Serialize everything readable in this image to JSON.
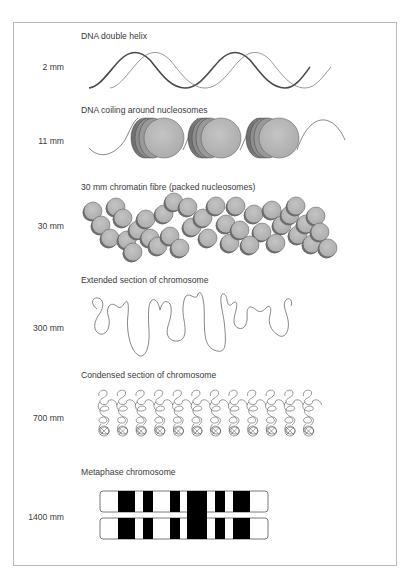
{
  "figure": {
    "stages": [
      {
        "title": "DNA double helix",
        "size_label": "2 mm"
      },
      {
        "title": "DNA coiling around nucleosomes",
        "size_label": "11 mm"
      },
      {
        "title": "30 mm chromatin fibre (packed nucleosomes)",
        "size_label": "30 mm"
      },
      {
        "title": "Extended section of chromosome",
        "size_label": "300 mm"
      },
      {
        "title": "Condensed section of chromosome",
        "size_label": "700 mm"
      },
      {
        "title": "Metaphase chromosome",
        "size_label": "1400 mm"
      }
    ],
    "colors": {
      "nucleosome_fill": "#b3b3b3",
      "nucleosome_shadow": "#8a8a8a",
      "band_dark": "#000000",
      "strand": "#555555"
    },
    "nucleosome_count": 3,
    "condensed_loop_columns": 12,
    "metaphase_dark_bands": 6
  }
}
